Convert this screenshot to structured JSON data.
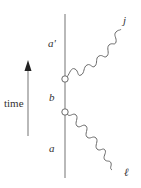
{
  "diagram": {
    "type": "worldline-interaction",
    "colors": {
      "line": "#8a8a8a",
      "wave": "#6a6a6a",
      "text": "#333333",
      "arrow": "#222222"
    },
    "time_axis": {
      "label": "time",
      "direction": "up"
    },
    "worldline": {
      "segments": [
        {
          "label": "a'",
          "position": "top"
        },
        {
          "label": "b",
          "position": "middle"
        },
        {
          "label": "a",
          "position": "bottom"
        }
      ],
      "vertices": 2
    },
    "wavy_lines": [
      {
        "label": "j",
        "direction": "outgoing-up-right"
      },
      {
        "label": "ℓ",
        "direction": "incoming-down-right"
      }
    ]
  }
}
